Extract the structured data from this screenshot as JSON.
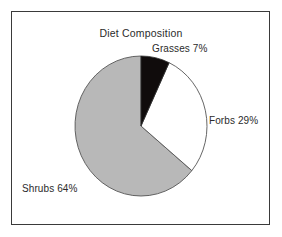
{
  "figure": {
    "title": "Diet Composition",
    "background_color": "#ffffff",
    "frame_color": "#3a3a3a"
  },
  "labels": {
    "grasses": "Grasses 7%",
    "forbs": "Forbs 29%",
    "shrubs": "Shrubs 64%"
  },
  "chart_data": {
    "type": "pie",
    "title": "Diet Composition",
    "xlabel": "",
    "ylabel": "",
    "categories": [
      "Grasses",
      "Forbs",
      "Shrubs"
    ],
    "values": [
      7,
      29,
      64
    ],
    "value_unit": "%",
    "data_labels": [
      "Grasses 7%",
      "Forbs 29%",
      "Shrubs 64%"
    ],
    "colors": [
      "#100c0c",
      "#ffffff",
      "#b8b8b8"
    ],
    "slice_outline_color": "#555555",
    "start_angle_deg": 90,
    "direction": "clockwise",
    "legend": "none",
    "grid": false,
    "label_positions": [
      "top-right",
      "right",
      "bottom-left"
    ]
  }
}
